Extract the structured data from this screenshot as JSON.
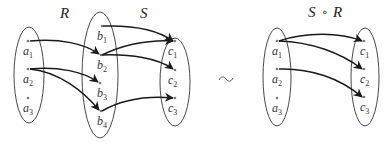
{
  "diagram": {
    "left": {
      "relation_labels": {
        "R": "R",
        "S": "S"
      },
      "sets": {
        "A": {
          "elements": [
            {
              "base": "a",
              "sub": "1"
            },
            {
              "base": "a",
              "sub": "2"
            },
            {
              "base": "a",
              "sub": "3"
            }
          ]
        },
        "B": {
          "elements": [
            {
              "base": "b",
              "sub": "1"
            },
            {
              "base": "b",
              "sub": "2"
            },
            {
              "base": "b",
              "sub": "3"
            },
            {
              "base": "b",
              "sub": "4"
            }
          ]
        },
        "C": {
          "elements": [
            {
              "base": "c",
              "sub": "1"
            },
            {
              "base": "c",
              "sub": "2"
            },
            {
              "base": "c",
              "sub": "3"
            }
          ]
        }
      },
      "R_edges": [
        [
          "a1",
          "b2"
        ],
        [
          "a2",
          "b3"
        ],
        [
          "a2",
          "b4"
        ]
      ],
      "S_edges": [
        [
          "b1",
          "c1"
        ],
        [
          "b2",
          "c1"
        ],
        [
          "b2",
          "c2"
        ],
        [
          "b4",
          "c3"
        ]
      ]
    },
    "squiggle": "~",
    "right": {
      "title": {
        "S": "S",
        "op": "∘",
        "R": "R"
      },
      "sets": {
        "A": {
          "elements": [
            {
              "base": "a",
              "sub": "1"
            },
            {
              "base": "a",
              "sub": "2"
            },
            {
              "base": "a",
              "sub": "3"
            }
          ]
        },
        "C": {
          "elements": [
            {
              "base": "c",
              "sub": "1"
            },
            {
              "base": "c",
              "sub": "2"
            },
            {
              "base": "c",
              "sub": "3"
            }
          ]
        }
      },
      "SR_edges": [
        [
          "a1",
          "c1"
        ],
        [
          "a1",
          "c2"
        ],
        [
          "a2",
          "c3"
        ]
      ]
    },
    "colors": {
      "stroke": "#1a1a1a",
      "ellipse": "#333333",
      "dot": "#777777"
    }
  }
}
